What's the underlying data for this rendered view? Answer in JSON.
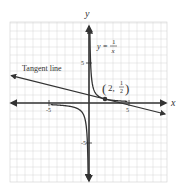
{
  "chart_data": {
    "type": "line",
    "title": "",
    "xlabel": "x",
    "ylabel": "y",
    "xlim": [
      -10,
      10
    ],
    "ylim": [
      -10,
      10
    ],
    "grid": true,
    "x_ticks": [
      {
        "value": -5,
        "label": "-5"
      },
      {
        "value": 5,
        "label": "5"
      }
    ],
    "y_ticks": [
      {
        "value": 5,
        "label": "5"
      },
      {
        "value": -5,
        "label": "-5"
      }
    ],
    "series": [
      {
        "name": "y = 1/x",
        "function": "1/x",
        "label_lhs": "y =",
        "label_num": "1",
        "label_den": "x",
        "color": "#333333"
      },
      {
        "name": "Tangent line",
        "function": "-x/4 + 1",
        "label": "Tangent line",
        "color": "#333333"
      }
    ],
    "annotations": [
      {
        "type": "point",
        "x": 2,
        "y": 0.5,
        "label_x": "2,",
        "label_num": "1",
        "label_den": "2"
      }
    ]
  },
  "colors": {
    "grid": "#d4d4d4",
    "grid_border": "#cfcfcf",
    "axis": "#333333",
    "curve": "#333333",
    "text": "#333333"
  }
}
